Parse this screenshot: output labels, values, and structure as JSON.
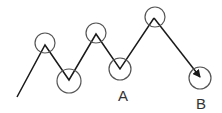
{
  "diagram": {
    "type": "zigzag-path",
    "colors": {
      "line": "#1a1a1a",
      "circle": "#555555",
      "label": "#333333"
    },
    "path_points": [
      {
        "x": 17,
        "y": 97
      },
      {
        "x": 45,
        "y": 45
      },
      {
        "x": 69,
        "y": 80
      },
      {
        "x": 96,
        "y": 34
      },
      {
        "x": 120,
        "y": 69
      },
      {
        "x": 154,
        "y": 18
      },
      {
        "x": 201,
        "y": 78
      }
    ],
    "circles": [
      {
        "cx": 45,
        "cy": 43,
        "r": 10
      },
      {
        "cx": 69,
        "cy": 81,
        "r": 12
      },
      {
        "cx": 96,
        "cy": 33,
        "r": 10
      },
      {
        "cx": 120,
        "cy": 69,
        "r": 11
      },
      {
        "cx": 155,
        "cy": 17,
        "r": 10
      },
      {
        "cx": 200,
        "cy": 78,
        "r": 11
      }
    ],
    "labels": {
      "a": "A",
      "b": "B"
    },
    "arrow_end": "B"
  }
}
